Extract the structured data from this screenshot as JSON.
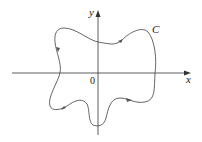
{
  "diagram": {
    "type": "closed curve in plane",
    "axes": {
      "x_label": "x",
      "y_label": "y",
      "origin_label": "0"
    },
    "curve": {
      "label": "C",
      "orientation": "counterclockwise",
      "stroke_color": "#555555"
    },
    "colors": {
      "axis": "#333333",
      "curve": "#555555",
      "text": "#222222",
      "background": "#ffffff"
    }
  }
}
